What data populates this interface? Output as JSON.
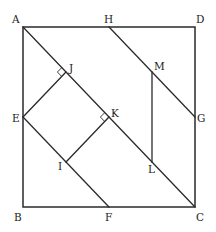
{
  "diagram": {
    "type": "geometry",
    "stroke_color": "#2a2a2a",
    "background": "#ffffff",
    "square": {
      "vertices": [
        "A",
        "B",
        "C",
        "D"
      ],
      "A": [
        23,
        27
      ],
      "B": [
        23,
        207
      ],
      "C": [
        195,
        207
      ],
      "D": [
        195,
        27
      ]
    },
    "points": {
      "A": {
        "x": 23,
        "y": 27,
        "label": "A",
        "lx": 12,
        "ly": 23
      },
      "H": {
        "x": 109,
        "y": 27,
        "label": "H",
        "lx": 104,
        "ly": 23
      },
      "D": {
        "x": 195,
        "y": 27,
        "label": "D",
        "lx": 196,
        "ly": 23
      },
      "E": {
        "x": 23,
        "y": 117,
        "label": "E",
        "lx": 12,
        "ly": 122
      },
      "G": {
        "x": 195,
        "y": 117,
        "label": "G",
        "lx": 197,
        "ly": 122
      },
      "B": {
        "x": 23,
        "y": 207,
        "label": "B",
        "lx": 14,
        "ly": 221
      },
      "F": {
        "x": 109,
        "y": 207,
        "label": "F",
        "lx": 105,
        "ly": 221
      },
      "C": {
        "x": 195,
        "y": 207,
        "label": "C",
        "lx": 196,
        "ly": 221
      },
      "J": {
        "x": 66,
        "y": 72,
        "label": "J",
        "lx": 69,
        "ly": 72
      },
      "K": {
        "x": 109,
        "y": 117,
        "label": "K",
        "lx": 111,
        "ly": 117
      },
      "I": {
        "x": 66,
        "y": 162,
        "label": "I",
        "lx": 58,
        "ly": 170
      },
      "M": {
        "x": 152,
        "y": 72,
        "label": "M",
        "lx": 154,
        "ly": 70
      },
      "L": {
        "x": 152,
        "y": 162,
        "label": "L",
        "lx": 148,
        "ly": 173
      }
    },
    "segments": [
      {
        "from": "A",
        "to": "C",
        "name": "diagonal-AC"
      },
      {
        "from": "E",
        "to": "F",
        "name": "segment-EF"
      },
      {
        "from": "H",
        "to": "G",
        "name": "segment-HG"
      },
      {
        "from": "E",
        "to": "J",
        "name": "segment-EJ"
      },
      {
        "from": "K",
        "to": "I",
        "name": "segment-KI"
      },
      {
        "from": "M",
        "to": "L",
        "name": "segment-ML"
      }
    ],
    "right_angles": [
      {
        "at": "J",
        "name": "right-angle-J"
      },
      {
        "at": "K",
        "name": "right-angle-K"
      }
    ],
    "labels": {
      "A": "A",
      "B": "B",
      "C": "C",
      "D": "D",
      "E": "E",
      "F": "F",
      "G": "G",
      "H": "H",
      "I": "I",
      "J": "J",
      "K": "K",
      "L": "L",
      "M": "M"
    }
  }
}
